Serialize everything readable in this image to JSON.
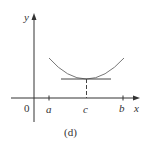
{
  "figure": {
    "caption": "(d)",
    "axes": {
      "x_label": "x",
      "y_label": "y",
      "origin_label": "0"
    },
    "ticks": [
      {
        "label": "a"
      },
      {
        "label": "c"
      },
      {
        "label": "b"
      }
    ],
    "colors": {
      "axes": "#333333",
      "curve": "#777777",
      "tangent": "#444444",
      "dashed": "#444444"
    }
  }
}
